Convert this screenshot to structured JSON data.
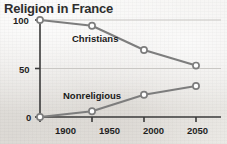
{
  "chart_data": {
    "type": "line",
    "title": "Religion in France",
    "xlabel": "",
    "ylabel": "",
    "x": [
      1900,
      1950,
      2000,
      2050
    ],
    "xtick_labels": [
      "1900",
      "1950",
      "2000",
      "2050"
    ],
    "ytick_labels": [
      "0",
      "50",
      "100"
    ],
    "yticks": [
      0,
      50,
      100
    ],
    "ylim": [
      0,
      100
    ],
    "xlim": [
      1900,
      2050
    ],
    "grid": true,
    "grid_axis": "y",
    "legend": "inline-labels",
    "series": [
      {
        "name": "Christians",
        "values": [
          100,
          94,
          69,
          53
        ],
        "color": "#7d7d7d",
        "marker": "open-circle"
      },
      {
        "name": "Nonreligious",
        "values": [
          0,
          6,
          23,
          32
        ],
        "color": "#7d7d7d",
        "marker": "open-circle"
      }
    ]
  },
  "colors": {
    "line": "#7d7d7d",
    "axis": "#3a3a3a",
    "grid": "#c9c7c4",
    "marker_fill": "#ffffff",
    "title": "#2e2e2e",
    "background": "#eceae7"
  }
}
